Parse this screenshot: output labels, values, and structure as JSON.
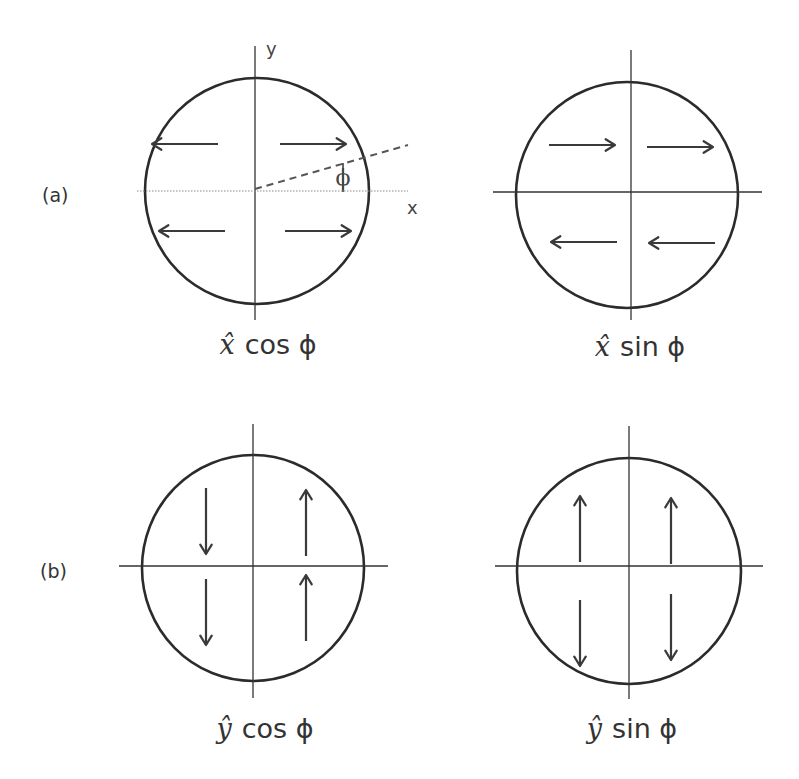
{
  "figure": {
    "row_labels": {
      "a": "(a)",
      "b": "(b)"
    },
    "axis_labels": {
      "x": "x",
      "y": "y",
      "angle": "ϕ"
    },
    "panels": [
      {
        "id": "a-left",
        "row": "a",
        "caption_vector": "x̂",
        "caption_function": "cos ϕ",
        "axes_style": "dotted-x",
        "shows_angle": true,
        "arrows": [
          {
            "quadrant": "upper-left",
            "direction": "left"
          },
          {
            "quadrant": "upper-right",
            "direction": "right"
          },
          {
            "quadrant": "lower-left",
            "direction": "left"
          },
          {
            "quadrant": "lower-right",
            "direction": "right"
          }
        ]
      },
      {
        "id": "a-right",
        "row": "a",
        "caption_vector": "x̂",
        "caption_function": "sin ϕ",
        "axes_style": "solid",
        "shows_angle": false,
        "arrows": [
          {
            "quadrant": "upper-left",
            "direction": "right"
          },
          {
            "quadrant": "upper-right",
            "direction": "right"
          },
          {
            "quadrant": "lower-left",
            "direction": "left"
          },
          {
            "quadrant": "lower-right",
            "direction": "left"
          }
        ]
      },
      {
        "id": "b-left",
        "row": "b",
        "caption_vector": "ŷ",
        "caption_function": "cos ϕ",
        "axes_style": "solid",
        "shows_angle": false,
        "arrows": [
          {
            "quadrant": "upper-left",
            "direction": "down"
          },
          {
            "quadrant": "upper-right",
            "direction": "up"
          },
          {
            "quadrant": "lower-left",
            "direction": "down"
          },
          {
            "quadrant": "lower-right",
            "direction": "up"
          }
        ]
      },
      {
        "id": "b-right",
        "row": "b",
        "caption_vector": "ŷ",
        "caption_function": "sin ϕ",
        "axes_style": "solid",
        "shows_angle": false,
        "arrows": [
          {
            "quadrant": "upper-left",
            "direction": "up"
          },
          {
            "quadrant": "upper-right",
            "direction": "up"
          },
          {
            "quadrant": "lower-left",
            "direction": "down"
          },
          {
            "quadrant": "lower-right",
            "direction": "down"
          }
        ]
      }
    ]
  }
}
